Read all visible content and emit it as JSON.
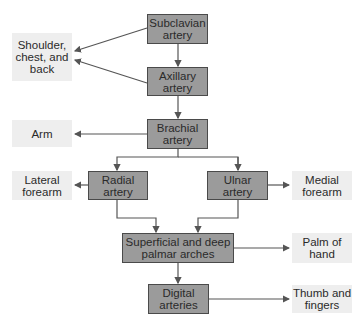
{
  "diagram": {
    "nodes": {
      "subclavian": "Subclavian\nartery",
      "axillary": "Axillary\nartery",
      "brachial": "Brachial\nartery",
      "radial": "Radial\nartery",
      "ulnar": "Ulnar\nartery",
      "palmar": "Superficial and deep\npalmar arches",
      "digital": "Digital\narteries"
    },
    "regions": {
      "shoulder": "Shoulder,\nchest, and\nback",
      "arm": "Arm",
      "lateral_forearm": "Lateral\nforearm",
      "medial_forearm": "Medial\nforearm",
      "palm": "Palm of\nhand",
      "fingers": "Thumb and\nfingers"
    },
    "colors": {
      "artery_box": "#9b9b9b",
      "region_box": "#eeeeee",
      "arrow": "#555555"
    }
  }
}
